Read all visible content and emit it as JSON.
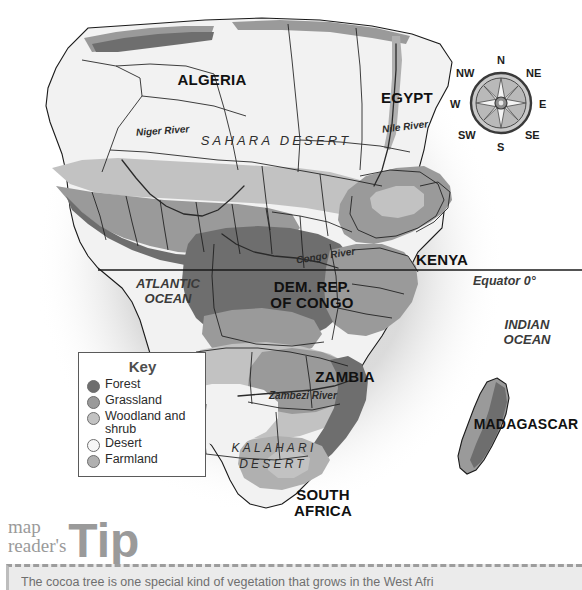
{
  "map": {
    "title": "Africa vegetation map",
    "countries": [
      {
        "name": "ALGERIA",
        "label": "ALGERIA",
        "x": 157,
        "y": 72,
        "w": 110
      },
      {
        "name": "EGYPT",
        "label": "EGYPT",
        "x": 362,
        "y": 90,
        "w": 90
      },
      {
        "name": "KENYA",
        "label": "KENYA",
        "x": 397,
        "y": 252,
        "w": 90
      },
      {
        "name": "DEM. REP. OF CONGO",
        "label": "DEM. REP.\nOF CONGO",
        "x": 253,
        "y": 279,
        "w": 118
      },
      {
        "name": "ZAMBIA",
        "label": "ZAMBIA",
        "x": 299,
        "y": 369,
        "w": 92
      },
      {
        "name": "SOUTH AFRICA",
        "label": "SOUTH\nAFRICA",
        "x": 280,
        "y": 487,
        "w": 86
      },
      {
        "name": "MADAGASCAR",
        "label": "MADAGASCAR",
        "x": 471,
        "y": 417,
        "w": 110
      }
    ],
    "oceans": [
      {
        "name": "ATLANTIC OCEAN",
        "label": "ATLANTIC\nOCEAN",
        "x": 120,
        "y": 276,
        "w": 96
      },
      {
        "name": "INDIAN OCEAN",
        "label": "INDIAN\nOCEAN",
        "x": 487,
        "y": 317,
        "w": 80
      }
    ],
    "deserts": [
      {
        "name": "SAHARA DESERT",
        "label": "SAHARA   DESERT",
        "x": 181,
        "y": 134,
        "w": 190,
        "size": 13
      },
      {
        "name": "KALAHARI",
        "label": "KALAHARI",
        "x": 219,
        "y": 442,
        "w": 110,
        "size": 12
      },
      {
        "name": "DESERT",
        "label": "DESERT",
        "x": 228,
        "y": 458,
        "w": 90,
        "size": 12
      }
    ],
    "rivers": [
      {
        "name": "Niger River",
        "label": "Niger River",
        "x": 136,
        "y": 126,
        "rot": -4
      },
      {
        "name": "Nile River",
        "label": "Nile River",
        "x": 382,
        "y": 122,
        "rot": -7
      },
      {
        "name": "Congo River",
        "label": "Congo River",
        "x": 296,
        "y": 251,
        "rot": -9
      },
      {
        "name": "Zambezi River",
        "label": "Zambezi River",
        "x": 269,
        "y": 391,
        "rot": 0
      }
    ],
    "equator": {
      "label": "Equator 0°",
      "label_x": 473,
      "label_y": 275,
      "line_y": 270,
      "line_x1": 98,
      "line_x2": 582
    }
  },
  "compass": {
    "name": "compass-rose",
    "directions": [
      {
        "key": "N",
        "label": "N",
        "x": 45,
        "y": -2
      },
      {
        "key": "NE",
        "label": "NE",
        "x": 74,
        "y": 11
      },
      {
        "key": "E",
        "label": "E",
        "x": 87,
        "y": 42
      },
      {
        "key": "SE",
        "label": "SE",
        "x": 73,
        "y": 73
      },
      {
        "key": "S",
        "label": "S",
        "x": 45,
        "y": 85
      },
      {
        "key": "SW",
        "label": "SW",
        "x": 6,
        "y": 73
      },
      {
        "key": "W",
        "label": "W",
        "x": -2,
        "y": 42
      },
      {
        "key": "NW",
        "label": "NW",
        "x": 4,
        "y": 11
      }
    ]
  },
  "key": {
    "title": "Key",
    "items": [
      {
        "label": "Forest",
        "color": "#6e6e6e"
      },
      {
        "label": "Grassland",
        "color": "#9a9a9a"
      },
      {
        "label": "Woodland and shrub",
        "color": "#c2c2c2"
      },
      {
        "label": "Desert",
        "color": "#f2f2f2"
      },
      {
        "label": "Farmland",
        "color": "#b0b0b0"
      }
    ]
  },
  "tip": {
    "small_line1": "map",
    "small_line2": "reader's",
    "big": "Tip",
    "body": "The cocoa tree is one special kind of vegetation that grows in the West Afri"
  },
  "colors": {
    "forest": "#6e6e6e",
    "grassland": "#9a9a9a",
    "woodland": "#c2c2c2",
    "desert": "#f2f2f2",
    "farmland": "#b0b0b0",
    "border": "#1a1a1a",
    "ocean_bg": "#ffffff",
    "panel_bg": "#ebebeb"
  }
}
